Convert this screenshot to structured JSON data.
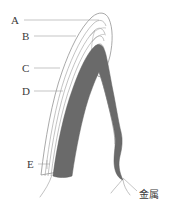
{
  "figure": {
    "background_color": "#ffffff",
    "width": 175,
    "height": 213,
    "colors": {
      "metal_band": "#6a6a6a",
      "metal_band_shadow": "#585858",
      "contour_line": "#9a9a9a",
      "outer_outline": "#8c8c8c",
      "leader_line": "#a0a0a0",
      "label_text": "#3a3a3a"
    },
    "callouts": [
      {
        "id": "A",
        "label": "A",
        "label_x": 11,
        "label_y": 15,
        "leader_x1": 24,
        "leader_y1": 20,
        "leader_x2": 99,
        "leader_y2": 20
      },
      {
        "id": "B",
        "label": "B",
        "label_x": 22,
        "label_y": 31,
        "leader_x1": 34,
        "leader_y1": 36,
        "leader_x2": 76,
        "leader_y2": 36
      },
      {
        "id": "C",
        "label": "C",
        "label_x": 22,
        "label_y": 63,
        "leader_x1": 34,
        "leader_y1": 68,
        "leader_x2": 60,
        "leader_y2": 68
      },
      {
        "id": "D",
        "label": "D",
        "label_x": 22,
        "label_y": 86,
        "leader_x1": 34,
        "leader_y1": 91,
        "leader_x2": 63,
        "leader_y2": 91
      },
      {
        "id": "E",
        "label": "E",
        "label_x": 27,
        "label_y": 159,
        "leader_x1": 38,
        "leader_y1": 164,
        "leader_x2": 50,
        "leader_y2": 164
      }
    ],
    "annotations": [
      {
        "id": "metal",
        "label": "金属",
        "label_x": 139,
        "label_y": 190,
        "leader_x1": 137,
        "leader_y1": 191,
        "leader_x2": 123,
        "leader_y2": 178
      }
    ]
  }
}
